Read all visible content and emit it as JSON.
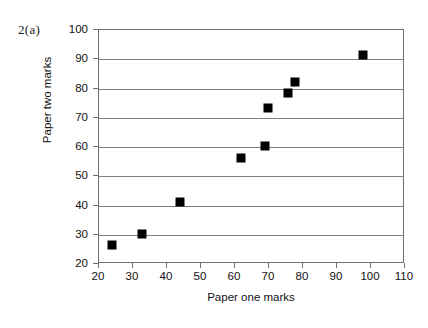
{
  "figure": {
    "question_label": "2(a)"
  },
  "chart_data": {
    "type": "scatter",
    "title": "",
    "xlabel": "Paper one marks",
    "ylabel": "Paper two marks",
    "xlim": [
      20,
      110
    ],
    "ylim": [
      20,
      100
    ],
    "xticks": [
      20,
      30,
      40,
      50,
      60,
      70,
      80,
      90,
      100,
      110
    ],
    "yticks": [
      20,
      30,
      40,
      50,
      60,
      70,
      80,
      90,
      100
    ],
    "xtick_labels": [
      "20",
      "30",
      "40",
      "50",
      "60",
      "70",
      "80",
      "90",
      "100",
      "110"
    ],
    "ytick_labels": [
      "20",
      "30",
      "40",
      "50",
      "60",
      "70",
      "80",
      "90",
      "100"
    ],
    "grid": "horizontal",
    "legend": null,
    "marker": "filled-square",
    "marker_color": "#000000",
    "x": [
      24,
      33,
      44,
      62,
      69,
      70,
      76,
      78,
      98
    ],
    "y": [
      26,
      30,
      41,
      56,
      60,
      73,
      78,
      82,
      91
    ],
    "points": [
      {
        "x": 24,
        "y": 26
      },
      {
        "x": 33,
        "y": 30
      },
      {
        "x": 44,
        "y": 41
      },
      {
        "x": 62,
        "y": 56
      },
      {
        "x": 69,
        "y": 60
      },
      {
        "x": 70,
        "y": 73
      },
      {
        "x": 76,
        "y": 78
      },
      {
        "x": 78,
        "y": 82
      },
      {
        "x": 98,
        "y": 91
      }
    ]
  }
}
